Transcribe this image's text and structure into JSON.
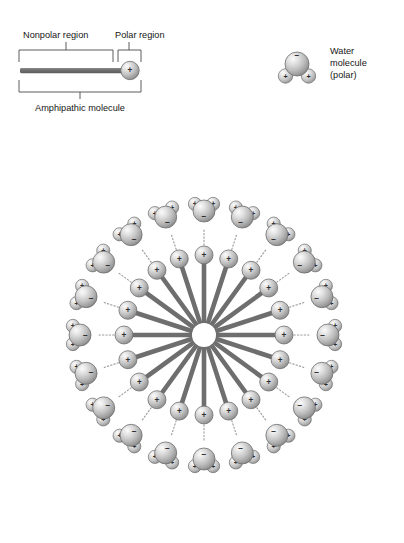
{
  "figure": {
    "type": "diagram",
    "background_color": "#ffffff"
  },
  "colors": {
    "tail": "#6e6e6e",
    "tail_dark": "#5a5a5a",
    "sphere_light": "#f2f2f2",
    "sphere_mid": "#c2c2c2",
    "sphere_dark": "#8a8a8a",
    "sphere_edge": "#6f6f6f",
    "bond_dotted": "#9a9a9a",
    "bracket": "#4a4a4a",
    "text": "#161616"
  },
  "molecule_legend": {
    "nonpolar_label": "Nonpolar region",
    "polar_label": "Polar region",
    "whole_label": "Amphipathic molecule",
    "head_charge": "+"
  },
  "water_legend": {
    "title_line1": "Water",
    "title_line2": "molecule",
    "title_line3": "(polar)",
    "oxygen_charge": "−",
    "hydrogen_charge": "+"
  },
  "micelle": {
    "center_x": 204,
    "center_y": 335,
    "core_radius": 12,
    "spoke_count": 20,
    "angle_step_deg": 18,
    "tail_inner_radius": 13,
    "tail_outer_radius": 72,
    "head_radius_px": 80,
    "head_sphere_r": 9,
    "bond_inner_radius": 90,
    "bond_outer_radius": 106,
    "water_radius_px": 124,
    "head_charge": "+",
    "water_oxygen_charge": "−",
    "water_hydrogen_charge": "+",
    "spoke_angles_deg": [
      270,
      288,
      306,
      324,
      342,
      0,
      18,
      36,
      54,
      72,
      90,
      108,
      126,
      144,
      162,
      180,
      198,
      216,
      234,
      252
    ]
  },
  "water_geometry": {
    "oxygen_r": 11,
    "hydrogen_r": 6.6,
    "hydrogen_offset": 11.5,
    "hydrogen_half_angle_deg": 52
  }
}
